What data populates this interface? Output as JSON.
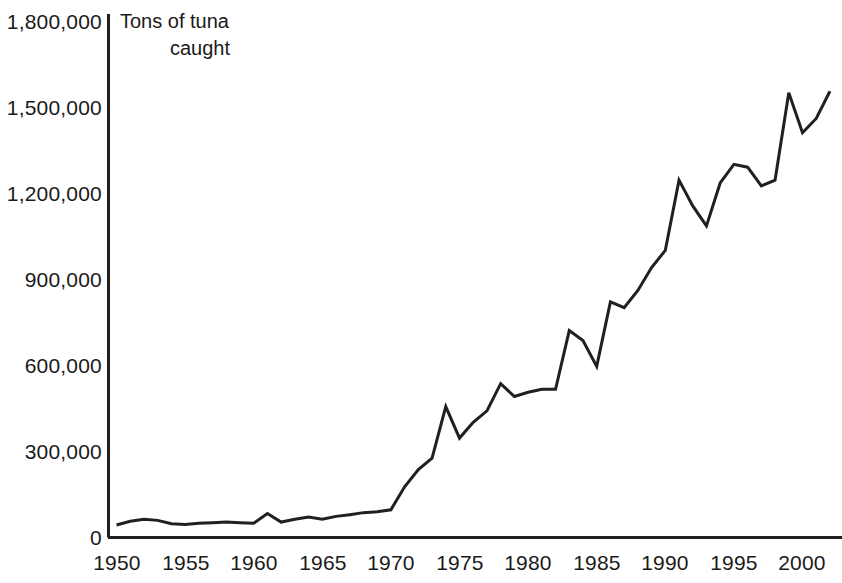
{
  "chart_data": {
    "type": "line",
    "title": "Tons of tuna caught",
    "title_line1": "Tons of tuna",
    "title_line2": "caught",
    "xlabel": "",
    "ylabel": "Tons of tuna caught",
    "xlim": [
      1950,
      2003
    ],
    "ylim": [
      0,
      1800000
    ],
    "grid": false,
    "legend": null,
    "line_color": "#231f20",
    "y_ticks": [
      0,
      300000,
      600000,
      900000,
      1200000,
      1500000,
      1800000
    ],
    "y_tick_labels": [
      "0",
      "300,000",
      "600,000",
      "900,000",
      "1,200,000",
      "1,500,000",
      "1,800,000"
    ],
    "x_ticks": [
      1950,
      1955,
      1960,
      1965,
      1970,
      1975,
      1980,
      1985,
      1990,
      1995,
      2000
    ],
    "x_tick_labels": [
      "1950",
      "1955",
      "1960",
      "1965",
      "1970",
      "1975",
      "1980",
      "1985",
      "1990",
      "1995",
      "2000"
    ],
    "x": [
      1950,
      1951,
      1952,
      1953,
      1954,
      1955,
      1956,
      1957,
      1958,
      1959,
      1960,
      1961,
      1962,
      1963,
      1964,
      1965,
      1966,
      1967,
      1968,
      1969,
      1970,
      1971,
      1972,
      1973,
      1974,
      1975,
      1976,
      1977,
      1978,
      1979,
      1980,
      1981,
      1982,
      1983,
      1984,
      1985,
      1986,
      1987,
      1988,
      1989,
      1990,
      1991,
      1992,
      1993,
      1994,
      1995,
      1996,
      1997,
      1998,
      1999,
      2000,
      2001,
      2002
    ],
    "values": [
      42000,
      55000,
      62000,
      58000,
      46000,
      44000,
      48000,
      50000,
      52000,
      50000,
      48000,
      82000,
      52000,
      62000,
      70000,
      62000,
      72000,
      78000,
      85000,
      88000,
      95000,
      175000,
      235000,
      275000,
      455000,
      345000,
      400000,
      440000,
      535000,
      490000,
      505000,
      515000,
      515000,
      720000,
      685000,
      595000,
      820000,
      800000,
      860000,
      940000,
      1000000,
      1245000,
      1155000,
      1085000,
      1235000,
      1300000,
      1290000,
      1225000,
      1245000,
      1550000,
      1410000,
      1460000,
      1555000
    ],
    "series": [
      {
        "name": "Tons of tuna caught",
        "values": [
          42000,
          55000,
          62000,
          58000,
          46000,
          44000,
          48000,
          50000,
          52000,
          50000,
          48000,
          82000,
          52000,
          62000,
          70000,
          62000,
          72000,
          78000,
          85000,
          88000,
          95000,
          175000,
          235000,
          275000,
          455000,
          345000,
          400000,
          440000,
          535000,
          490000,
          505000,
          515000,
          515000,
          720000,
          685000,
          595000,
          820000,
          800000,
          860000,
          940000,
          1000000,
          1245000,
          1155000,
          1085000,
          1235000,
          1300000,
          1290000,
          1225000,
          1245000,
          1550000,
          1410000,
          1460000,
          1555000
        ]
      }
    ]
  },
  "axes": {
    "y_axis_name": "y-axis",
    "x_axis_name": "x-axis"
  }
}
